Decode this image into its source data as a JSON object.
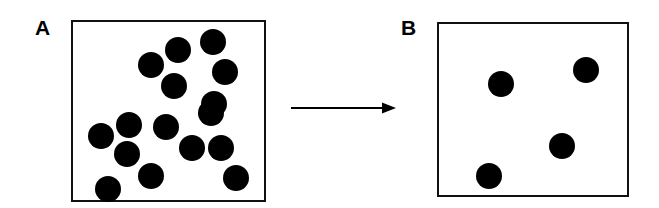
{
  "figure": {
    "type": "schematic-diagram",
    "background_color": "#ffffff",
    "particle_color": "#000000",
    "box_border_color": "#111111",
    "canvas": {
      "width": 659,
      "height": 208
    }
  },
  "panels": [
    {
      "id": "A",
      "label": "A",
      "label_position": {
        "x": 35,
        "y": 17
      },
      "box": {
        "x": 71,
        "y": 20,
        "width": 195,
        "height": 182
      },
      "particle_count": 16,
      "particle_radius": 13,
      "particles": [
        {
          "cx": 213,
          "cy": 42
        },
        {
          "cx": 178,
          "cy": 50
        },
        {
          "cx": 151,
          "cy": 65
        },
        {
          "cx": 225,
          "cy": 72
        },
        {
          "cx": 174,
          "cy": 86
        },
        {
          "cx": 214,
          "cy": 104
        },
        {
          "cx": 211,
          "cy": 113
        },
        {
          "cx": 129,
          "cy": 125
        },
        {
          "cx": 166,
          "cy": 127
        },
        {
          "cx": 101,
          "cy": 136
        },
        {
          "cx": 127,
          "cy": 154
        },
        {
          "cx": 192,
          "cy": 148
        },
        {
          "cx": 221,
          "cy": 148
        },
        {
          "cx": 151,
          "cy": 176
        },
        {
          "cx": 236,
          "cy": 178
        },
        {
          "cx": 108,
          "cy": 189
        }
      ]
    },
    {
      "id": "B",
      "label": "B",
      "label_position": {
        "x": 401,
        "y": 17
      },
      "box": {
        "x": 437,
        "y": 22,
        "width": 192,
        "height": 175
      },
      "particle_count": 4,
      "particle_radius": 13,
      "particles": [
        {
          "cx": 501,
          "cy": 84
        },
        {
          "cx": 586,
          "cy": 70
        },
        {
          "cx": 562,
          "cy": 146
        },
        {
          "cx": 489,
          "cy": 176
        }
      ]
    }
  ],
  "arrow": {
    "name": "transition-arrow",
    "from": {
      "x": 291,
      "y": 108
    },
    "to": {
      "x": 396,
      "y": 108
    },
    "stroke_width": 2,
    "color": "#000000",
    "head_length": 14,
    "head_width": 11
  }
}
